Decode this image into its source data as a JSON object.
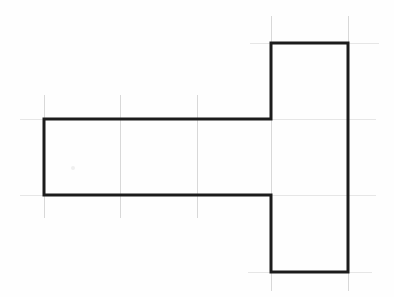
{
  "figure": {
    "background_color": "#fefefe",
    "outline_color": "#1c1c1c",
    "outline_width_px": 3,
    "grid_color": "#d8d8d8",
    "grid_faint_color": "#e6e6e6",
    "canvas": {
      "width": 394,
      "height": 297
    },
    "outline_points": "44,119 271,119 271,43 348,43 348,272 271,272 271,195 44,195",
    "vertices": [
      {
        "name": "bar-top-left",
        "x": 44,
        "y": 119
      },
      {
        "name": "bar-top-right-inner",
        "x": 271,
        "y": 119
      },
      {
        "name": "column-top-left",
        "x": 271,
        "y": 43
      },
      {
        "name": "column-top-right",
        "x": 348,
        "y": 43
      },
      {
        "name": "column-bottom-right",
        "x": 348,
        "y": 272
      },
      {
        "name": "column-bottom-left",
        "x": 271,
        "y": 272
      },
      {
        "name": "bar-bottom-right-inner",
        "x": 271,
        "y": 195
      },
      {
        "name": "bar-bottom-left",
        "x": 44,
        "y": 195
      }
    ],
    "grid_lines": {
      "vertical_left_group": [
        {
          "x": 44,
          "y1": 95,
          "y2": 218
        },
        {
          "x": 120,
          "y1": 95,
          "y2": 218
        },
        {
          "x": 197,
          "y1": 95,
          "y2": 218
        }
      ],
      "vertical_right_group": [
        {
          "x": 271,
          "y1": 16,
          "y2": 291
        },
        {
          "x": 348,
          "y1": 16,
          "y2": 291
        }
      ],
      "horizontal_long": [
        {
          "y": 119,
          "x1": 20,
          "x2": 376
        },
        {
          "y": 195,
          "x1": 20,
          "x2": 376
        }
      ],
      "horizontal_short": [
        {
          "y": 43,
          "x1": 250,
          "x2": 379
        },
        {
          "y": 272,
          "x1": 248,
          "x2": 372
        }
      ]
    },
    "marks": [
      {
        "name": "paper-speck",
        "x": 73,
        "y": 168,
        "r": 2
      }
    ]
  }
}
